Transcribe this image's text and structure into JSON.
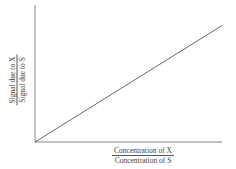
{
  "chart_data": {
    "type": "line",
    "title": "",
    "xlabel": "Concentration of X / Concentration of S",
    "ylabel": "Signal due to X / Signal due to S",
    "xlabel_parts": {
      "numerator": "Concentration of X",
      "denominator": "Concentration of S"
    },
    "ylabel_parts": {
      "numerator": "Signal due to X",
      "denominator": "Signal due to S"
    },
    "series": [
      {
        "name": "calibration",
        "x": [
          0,
          1
        ],
        "y": [
          0,
          0.85
        ]
      }
    ],
    "xlim": [
      0,
      1
    ],
    "ylim": [
      0,
      1
    ],
    "grid": false,
    "ticks": false,
    "legend": null
  },
  "colors": {
    "axis": "#666666",
    "line": "#555555",
    "text": "#444444"
  }
}
